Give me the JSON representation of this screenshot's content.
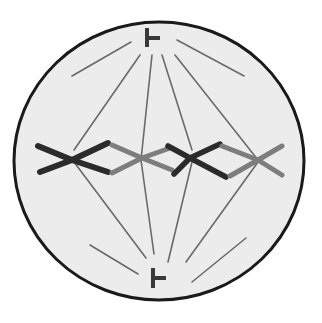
{
  "diagram": {
    "title": "Cell in metaphase",
    "labels": [],
    "colors": {
      "background": "#ffffff",
      "cell_fill": "#ececec",
      "cell_outline": "#1a1a1a",
      "spindle_fiber": "#6a6a6a",
      "chromosome_dark": "#2b2b2b",
      "chromosome_light": "#7d7d7d",
      "centriole": "#3a3a3a"
    },
    "elements": {
      "cell_membrane": "cell-membrane",
      "spindle_poles": [
        "top-spindle-pole",
        "bottom-spindle-pole"
      ],
      "chromosome_count": 4,
      "metaphase_plate": "chromosomes aligned at cell equator"
    }
  }
}
